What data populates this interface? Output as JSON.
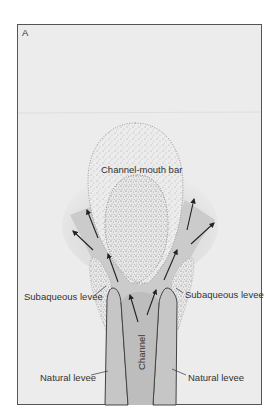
{
  "figure": {
    "panel_label": "A",
    "labels": {
      "channel_mouth_bar": "Channel-mouth bar",
      "subaqueous_levee_left": "Subaqueous levee",
      "subaqueous_levee_right": "Subaqueous levee",
      "natural_levee_left": "Natural levee",
      "natural_levee_right": "Natural levee",
      "channel": "Channel"
    },
    "colors": {
      "background": "#ececec",
      "frame": "#555555",
      "plume": "#cbcbcb",
      "channel": "#bdbdbd",
      "levee": "#c6c6c6",
      "bar": "#eeeeee",
      "arrow": "#222222"
    }
  }
}
